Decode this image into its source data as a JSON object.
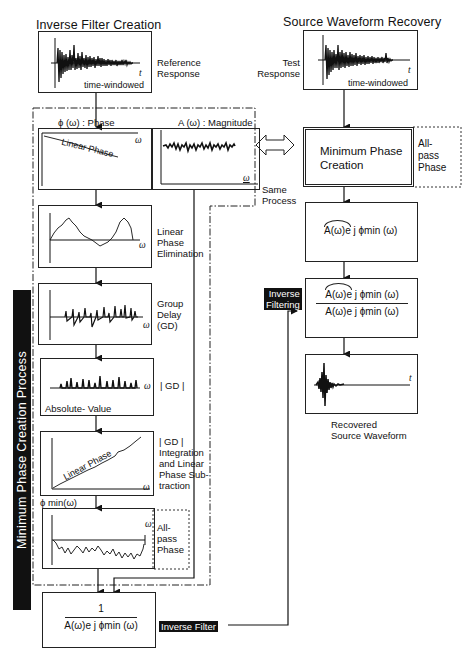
{
  "left_column": {
    "title": "Inverse Filter Creation",
    "reference": {
      "label_line1": "Reference",
      "label_line2": "Response",
      "caption": "time-windowed",
      "axis": "t"
    },
    "phase_header": "ϕ (ω) :  Phase",
    "magnitude_header": "A (ω) : Magnitude",
    "phase_plot": {
      "curve_label": "Linear Phase",
      "axis": "ω"
    },
    "magnitude_plot": {
      "axis": "ω"
    },
    "steps": [
      {
        "id": "linear-phase-elimination",
        "label_lines": [
          "Linear",
          "Phase",
          "Elimination"
        ],
        "axis": "ω"
      },
      {
        "id": "group-delay",
        "label_lines": [
          "Group",
          "Delay",
          "(GD)"
        ],
        "axis": "ω"
      },
      {
        "id": "absolute-value",
        "label_lines": [
          "| GD |"
        ],
        "caption": "Absolute- Value",
        "axis": "ω"
      },
      {
        "id": "integration",
        "label_lines": [
          "| GD |",
          "Integration",
          "and  Linear",
          "Phase  Sub-",
          "traction"
        ],
        "curve_label": "Linear Phase",
        "axis": "ω"
      },
      {
        "id": "min-phase",
        "header": "ϕ  min(ω)",
        "label_lines": [
          "All-",
          "pass",
          "Phase"
        ],
        "axis": "ω"
      }
    ],
    "process_label": "Minimum  Phase  Creation  Process",
    "inverse_filter_box": {
      "numerator": "1",
      "denominator": "A(ω)e j ϕmin (ω)"
    },
    "inverse_filter_tag": "Inverse  Filter"
  },
  "right_column": {
    "title": "Source  Waveform  Recovery",
    "test": {
      "label_line1": "Test",
      "label_line2": "Response",
      "caption": "time-windowed",
      "axis": "t"
    },
    "min_phase_box": {
      "line1": "Minimum  Phase",
      "line2": "Creation"
    },
    "all_pass_label": [
      "All-",
      "pass",
      "Phase"
    ],
    "same_process_label": [
      "Same",
      "Process"
    ],
    "estimate_box": {
      "hat_term": "A(ω)e",
      "rest": " j ϕmin (ω)"
    },
    "inverse_filtering_tag": [
      "Inverse",
      "Filtering"
    ],
    "division_box": {
      "numerator_hat": "A(ω)e",
      "numerator_rest": " j ϕmin (ω)",
      "denominator": "A(ω)e  j ϕmin (ω)"
    },
    "recovered": {
      "axis": "t",
      "label_line1": "Recovered",
      "label_line2": "Source  Waveform"
    }
  }
}
